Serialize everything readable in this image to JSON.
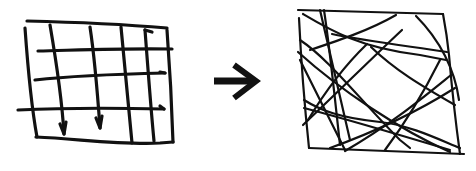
{
  "diagram": {
    "left_panel": {
      "label": "Ordered grid",
      "stroke_color": "#111111"
    },
    "arrow": {
      "label": "transforms into",
      "icon": "right-arrow-icon"
    },
    "right_panel": {
      "label": "Tangled lines",
      "stroke_color": "#111111"
    },
    "background": "#ffffff"
  }
}
